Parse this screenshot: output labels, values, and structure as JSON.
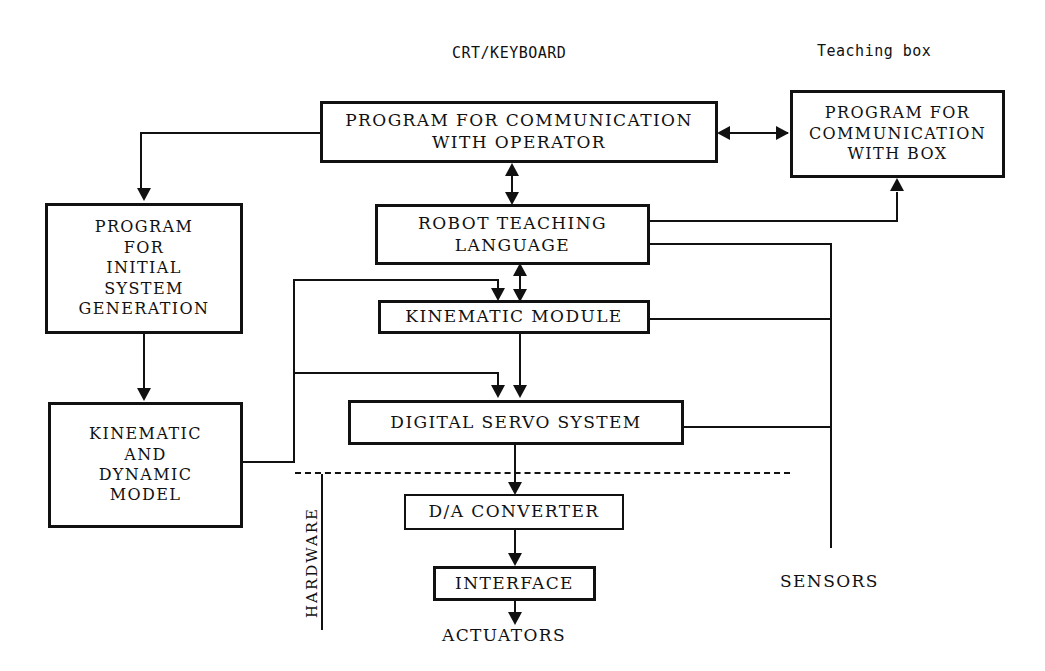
{
  "diagram": {
    "ink_color": "#111111",
    "background_color": "#ffffff",
    "boxes": {
      "program_communication_operator": "PROGRAM FOR COMMUNICATION\nWITH OPERATOR",
      "program_communication_box": "PROGRAM FOR\nCOMMUNICATION\nWITH BOX",
      "program_initial_system_generation": "PROGRAM\nFOR\nINITIAL\nSYSTEM\nGENERATION",
      "kinematic_and_dynamic_model": "KINEMATIC\nAND\nDYNAMIC\nMODEL",
      "robot_teaching_language": "ROBOT TEACHING\nLANGUAGE",
      "kinematic_module": "KINEMATIC MODULE",
      "digital_servo_system": "DIGITAL SERVO SYSTEM",
      "da_converter": "D/A CONVERTER",
      "interface": "INTERFACE"
    },
    "labels": {
      "crt_keyboard": "CRT/KEYBOARD",
      "teaching_box": "Teaching box",
      "hardware": "HARDWARE",
      "sensors": "SENSORS",
      "actuators": "ACTUATORS"
    }
  }
}
